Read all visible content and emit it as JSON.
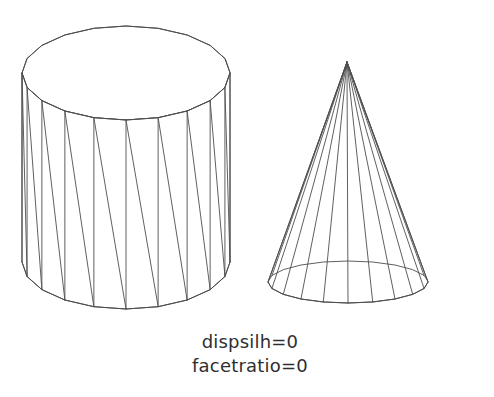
{
  "figure": {
    "background_color": "#ffffff",
    "line_color": "#4e4e50",
    "text_color": "#2e2e30",
    "width": 494,
    "height": 397
  },
  "caption": {
    "line1": "dispsilh=0",
    "line2": "facetratio=0",
    "line1_x": 250,
    "line1_y": 348,
    "line2_x": 250,
    "line2_y": 372,
    "font_size": 18
  },
  "shapes": {
    "cylinder": {
      "name": "faceted-cylinder",
      "label": "cylinder",
      "center_x": 126,
      "top_center_y": 73,
      "bottom_center_y": 262,
      "radius_x": 104,
      "radius_y": 47,
      "facets": 20,
      "triangulated": true,
      "triangulation_direction": "top-left-to-bottom-right"
    },
    "cone": {
      "name": "faceted-cone",
      "label": "cone",
      "apex_x": 347,
      "apex_y": 62,
      "base_center_x": 348,
      "base_center_y": 282,
      "radius_x": 80,
      "radius_y": 21,
      "facets": 20
    }
  },
  "chart_data": {
    "type": "diagram",
    "annotations": [
      "dispsilh=0",
      "facetratio=0"
    ],
    "objects": [
      {
        "name": "cylinder",
        "facets": 20,
        "style": "wireframe-triangulated"
      },
      {
        "name": "cone",
        "facets": 20,
        "style": "wireframe-radial"
      }
    ]
  }
}
